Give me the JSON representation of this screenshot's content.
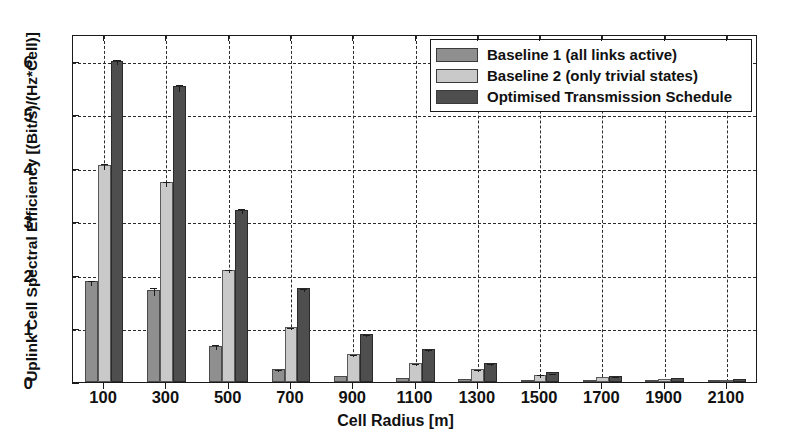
{
  "chart_data": {
    "type": "bar",
    "title": "",
    "xlabel": "Cell Radius [m]",
    "ylabel": "Uplink Cell Spectral Efficiency [(Bit/s)/(Hz*Cell)]",
    "categories": [
      "100",
      "300",
      "500",
      "700",
      "900",
      "1100",
      "1300",
      "1500",
      "1700",
      "1900",
      "2100"
    ],
    "xlim": [
      0,
      11
    ],
    "ylim": [
      0,
      6.5
    ],
    "yticks": [
      0,
      1,
      2,
      3,
      4,
      5,
      6
    ],
    "ytick_labels": [
      "0",
      "1",
      "2",
      "3",
      "4",
      "5",
      "6"
    ],
    "grid": "dashed both axes",
    "legend_position": "top-right inside",
    "series": [
      {
        "name": "Baseline 1 (all links active)",
        "color": "#8f8f8f",
        "values": [
          1.88,
          1.72,
          0.68,
          0.25,
          0.11,
          0.07,
          0.05,
          0.03,
          0.02,
          0.02,
          0.01
        ],
        "errors": [
          0.05,
          0.08,
          0.04,
          0.02,
          0.02,
          0.01,
          0.01,
          0.01,
          0.01,
          0.01,
          0.01
        ]
      },
      {
        "name": "Baseline 2 (only trivial states)",
        "color": "#c9c9c9",
        "values": [
          4.05,
          3.73,
          2.1,
          1.03,
          0.52,
          0.35,
          0.24,
          0.14,
          0.09,
          0.05,
          0.03
        ],
        "errors": [
          0.06,
          0.05,
          0.03,
          0.02,
          0.02,
          0.02,
          0.02,
          0.02,
          0.02,
          0.02,
          0.02
        ]
      },
      {
        "name": "Optimised Transmission Schedule",
        "color": "#4e4e4e",
        "values": [
          6.0,
          5.52,
          3.22,
          1.75,
          0.9,
          0.62,
          0.35,
          0.18,
          0.12,
          0.07,
          0.05
        ],
        "errors": [
          0.05,
          0.07,
          0.04,
          0.03,
          0.02,
          0.02,
          0.02,
          0.01,
          0.01,
          0.01,
          0.01
        ]
      }
    ]
  },
  "legend": {
    "items": [
      {
        "label": "Baseline 1 (all links active)",
        "color": "#8f8f8f",
        "swatch_class": "s0"
      },
      {
        "label": "Baseline 2 (only trivial states)",
        "color": "#c9c9c9",
        "swatch_class": "s1"
      },
      {
        "label": "Optimised Transmission Schedule",
        "color": "#4e4e4e",
        "swatch_class": "s2"
      }
    ]
  },
  "axes": {
    "x_title": "Cell Radius [m]",
    "y_title": "Uplink Cell Spectral Efficiency [(Bit/s)/(Hz*Cell)]"
  }
}
